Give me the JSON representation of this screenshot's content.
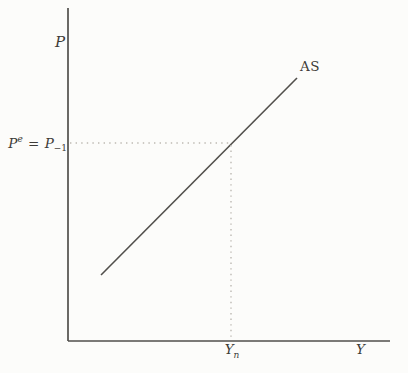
{
  "figure": {
    "bg_color": "#fcfcfa",
    "line_color": "#514f4b",
    "dotted_color": "#bdb9b2",
    "text_color": "#3d3b37"
  },
  "labels": {
    "price_axis": "P",
    "output_axis": "Y",
    "as_curve": "AS",
    "expected_price": {
      "p": "P",
      "sup": "e",
      "equals": "=",
      "p2": "P",
      "sub": "−1"
    },
    "natural_output": {
      "base": "Y",
      "sub": "n"
    }
  },
  "chart_data": {
    "type": "line",
    "xlabel": "Y",
    "ylabel": "P",
    "grid": false,
    "legend": false,
    "series": [
      {
        "name": "AS",
        "points_px": [
          [
            101,
            275
          ],
          [
            297,
            78
          ]
        ]
      }
    ],
    "equilibrium_point_px": [
      231,
      143
    ],
    "reference_lines": {
      "horizontal_dotted_px": [
        [
          70,
          143
        ],
        [
          229,
          143
        ]
      ],
      "vertical_dotted_px": [
        [
          231,
          145
        ],
        [
          231,
          339
        ]
      ]
    },
    "axes_px": {
      "origin": [
        68,
        341
      ],
      "x_end": [
        390,
        341
      ],
      "y_top": [
        68,
        8
      ]
    },
    "x_tick_labels": [
      "Yₙ"
    ],
    "y_tick_labels": [
      "Pᵉ = P₋₁"
    ]
  }
}
